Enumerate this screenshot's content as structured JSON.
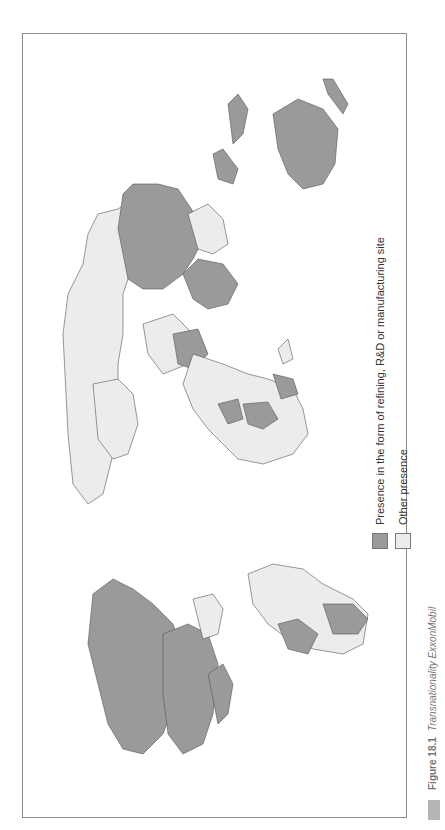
{
  "figure": {
    "caption_label": "Figure 18.1",
    "caption_title": "Transnationality ExxonMobil",
    "orientation": "rotated 90° (landscape page)"
  },
  "legend": {
    "items": [
      {
        "label": "Presence in the form of refining, R&D or manufacturing site",
        "color": "#9a9a9a"
      },
      {
        "label": "Other presence",
        "color": "#ececec"
      }
    ]
  },
  "colors": {
    "major_presence": "#9a9a9a",
    "other_presence": "#ececec",
    "no_presence": "#ffffff",
    "border": "#555555",
    "frame": "#8a8a8a"
  },
  "map": {
    "regions_major_presence": [
      "United States",
      "Canada",
      "Mexico (partial)",
      "Argentina",
      "Brazil (southeast)",
      "Russia (partial)",
      "China",
      "India",
      "Australia",
      "Japan",
      "Indonesia",
      "Saudi Arabia",
      "Nigeria",
      "Angola",
      "Chad",
      "Western Europe (several)"
    ],
    "regions_other_presence": [
      "Central & South America (most)",
      "Africa (most)",
      "Europe (most)",
      "Middle East (some)",
      "Central Asia",
      "Southeast Asia",
      "Greenland/Arctic",
      "Madagascar"
    ]
  }
}
